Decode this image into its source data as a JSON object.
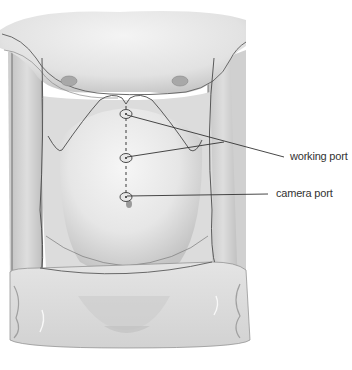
{
  "figure": {
    "labels": {
      "working_port": "working port",
      "camera_port": "camera port"
    },
    "ports": [
      {
        "name": "working-port-upper",
        "x": 126,
        "y": 114
      },
      {
        "name": "working-port-lower",
        "x": 126,
        "y": 158
      },
      {
        "name": "camera-port",
        "x": 126,
        "y": 197
      }
    ],
    "colors": {
      "skin_light": "#ececec",
      "skin_mid": "#d6d6d6",
      "skin_shadow": "#b8b8b8",
      "outline": "#4a4a4a",
      "drape": "#dcdcdc",
      "leader_line": "#333333",
      "text": "#333333"
    }
  }
}
